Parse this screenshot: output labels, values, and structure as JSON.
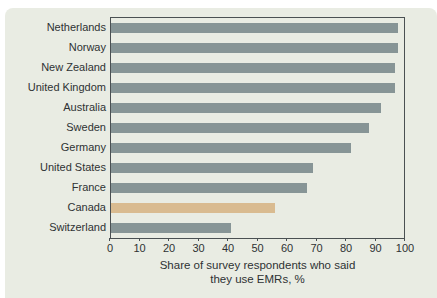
{
  "chart_data": {
    "type": "bar",
    "orientation": "horizontal",
    "categories": [
      "Netherlands",
      "Norway",
      "New Zealand",
      "United Kingdom",
      "Australia",
      "Sweden",
      "Germany",
      "United States",
      "France",
      "Canada",
      "Switzerland"
    ],
    "values": [
      98,
      98,
      97,
      97,
      92,
      88,
      82,
      69,
      67,
      56,
      41
    ],
    "highlighted_category": "Canada",
    "title": "",
    "xlabel_line1": "Share of survey respondents who said",
    "xlabel_line2": "they use EMRs, %",
    "xlim": [
      0,
      100
    ],
    "xticks": [
      "0",
      "10",
      "20",
      "30",
      "40",
      "50",
      "60",
      "70",
      "80",
      "90",
      "100"
    ],
    "grid": false,
    "legend": "none",
    "colors": {
      "bar": "#879596",
      "highlight_bar": "#d9bb90",
      "card_background": "#e9ece3",
      "frame": "#4a5052",
      "text": "#2e3233",
      "page_background": "#ffffff"
    }
  }
}
